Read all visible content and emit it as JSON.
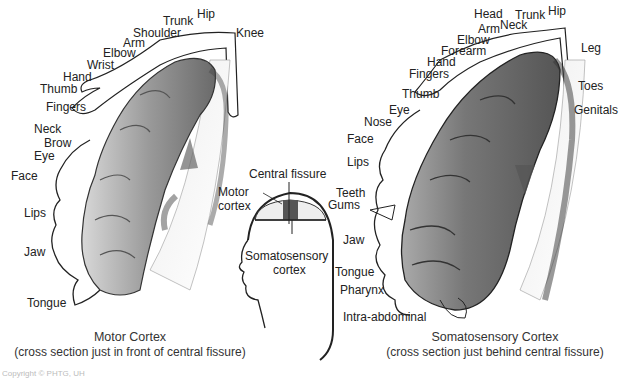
{
  "motor": {
    "title": "Motor Cortex",
    "subtitle": "(cross section just in front of central fissure)",
    "labels": [
      {
        "text": "Hip",
        "x": 197,
        "y": 8
      },
      {
        "text": "Trunk",
        "x": 163,
        "y": 17
      },
      {
        "text": "Shoulder",
        "x": 133,
        "y": 28
      },
      {
        "text": "Knee",
        "x": 236,
        "y": 28
      },
      {
        "text": "Arm",
        "x": 123,
        "y": 38
      },
      {
        "text": "Elbow",
        "x": 103,
        "y": 48
      },
      {
        "text": "Wrist",
        "x": 87,
        "y": 60
      },
      {
        "text": "Hand",
        "x": 63,
        "y": 71
      },
      {
        "text": "Thumb",
        "x": 40,
        "y": 83
      },
      {
        "text": "Fingers",
        "x": 46,
        "y": 102
      },
      {
        "text": "Neck",
        "x": 34,
        "y": 123
      },
      {
        "text": "Brow",
        "x": 44,
        "y": 137
      },
      {
        "text": "Eye",
        "x": 34,
        "y": 150
      },
      {
        "text": "Face",
        "x": 11,
        "y": 170
      },
      {
        "text": "Lips",
        "x": 24,
        "y": 206
      },
      {
        "text": "Jaw",
        "x": 24,
        "y": 245
      },
      {
        "text": "Tongue",
        "x": 27,
        "y": 296
      }
    ]
  },
  "inset": {
    "central_fissure": "Central fissure",
    "motor_cortex_1": "Motor",
    "motor_cortex_2": "cortex",
    "somato_1": "Somatosensory",
    "somato_2": "cortex"
  },
  "sensory": {
    "title": "Somatosensory Cortex",
    "subtitle": "(cross section just behind central fissure)",
    "labels": [
      {
        "text": "Head",
        "x": 474,
        "y": 8
      },
      {
        "text": "Trunk",
        "x": 515,
        "y": 10
      },
      {
        "text": "Hip",
        "x": 548,
        "y": 5
      },
      {
        "text": "Arm",
        "x": 478,
        "y": 23
      },
      {
        "text": "Neck",
        "x": 500,
        "y": 19
      },
      {
        "text": "Elbow",
        "x": 457,
        "y": 34
      },
      {
        "text": "Forearm",
        "x": 441,
        "y": 46
      },
      {
        "text": "Leg",
        "x": 581,
        "y": 43
      },
      {
        "text": "Hand",
        "x": 427,
        "y": 57
      },
      {
        "text": "Fingers",
        "x": 409,
        "y": 69
      },
      {
        "text": "Thumb",
        "x": 402,
        "y": 88
      },
      {
        "text": "Toes",
        "x": 578,
        "y": 80
      },
      {
        "text": "Eye",
        "x": 389,
        "y": 104
      },
      {
        "text": "Genitals",
        "x": 574,
        "y": 104
      },
      {
        "text": "Nose",
        "x": 364,
        "y": 116
      },
      {
        "text": "Face",
        "x": 347,
        "y": 133
      },
      {
        "text": "Lips",
        "x": 347,
        "y": 156
      },
      {
        "text": "Teeth",
        "x": 336,
        "y": 188
      },
      {
        "text": "Gums",
        "x": 328,
        "y": 198
      },
      {
        "text": "Jaw",
        "x": 343,
        "y": 235
      },
      {
        "text": "Tongue",
        "x": 335,
        "y": 266
      },
      {
        "text": "Pharynx",
        "x": 340,
        "y": 284
      },
      {
        "text": "Intra-abdominal",
        "x": 343,
        "y": 310
      }
    ]
  },
  "copyright": "Copyright © PHTG, UH"
}
